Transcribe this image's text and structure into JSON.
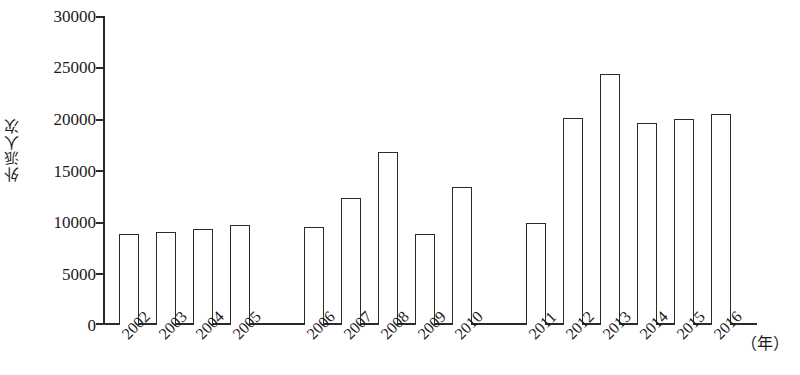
{
  "chart_data": {
    "type": "bar",
    "title": "",
    "xlabel": "（年）",
    "ylabel": "外派人次",
    "ylim": [
      0,
      30000
    ],
    "ytick_values": [
      0,
      5000,
      10000,
      15000,
      20000,
      25000,
      30000
    ],
    "ytick_labels": [
      "0",
      "5000",
      "10000",
      "15000",
      "20000",
      "25000",
      "30000"
    ],
    "grid": false,
    "legend": null,
    "categories": [
      "2002",
      "2003",
      "2004",
      "2005",
      "2006",
      "2007",
      "2008",
      "2009",
      "2010",
      "2011",
      "2012",
      "2013",
      "2014",
      "2015",
      "2016"
    ],
    "values": [
      8800,
      9000,
      9300,
      9700,
      9500,
      12300,
      16800,
      8800,
      13400,
      9900,
      20100,
      24400,
      19600,
      20000,
      20500
    ],
    "group_breaks_after": [
      "2005",
      "2010"
    ],
    "bar_style": {
      "fill": "#ffffff",
      "edge": "#2b2b2b"
    }
  },
  "axis": {
    "y_title": "外派人次",
    "x_unit": "（年）"
  }
}
